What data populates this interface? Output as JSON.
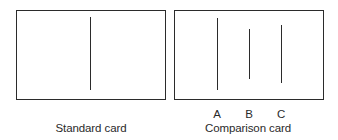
{
  "figure": {
    "standard_card": {
      "caption": "Standard card",
      "lines": [
        {
          "id": "standard",
          "x": 90,
          "y1": 17,
          "y2": 90
        }
      ]
    },
    "comparison_card": {
      "caption": "Comparison card",
      "lines": [
        {
          "id": "A",
          "label": "A",
          "x": 217,
          "y1": 18,
          "y2": 90
        },
        {
          "id": "B",
          "label": "B",
          "x": 249,
          "y1": 29,
          "y2": 79
        },
        {
          "id": "C",
          "label": "C",
          "x": 281,
          "y1": 25,
          "y2": 83
        }
      ]
    },
    "colors": {
      "stroke": "#2b2b2b",
      "text": "#2a2a2a",
      "background": "#ffffff"
    }
  }
}
